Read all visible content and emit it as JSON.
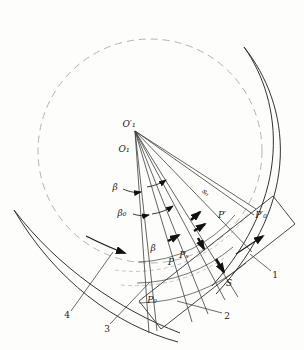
{
  "figure": {
    "kind": "geometric construction diagram (rotor / vane profile with angle fan)",
    "labels": {
      "center_prime": "O′₁",
      "center": "O₁",
      "angle_beta_upper": "β",
      "angle_beta_zero": "β₀",
      "angle_beta_lower": "β",
      "stroke_s_zero": "s₀",
      "point_p_prime": "P′",
      "point_p_zero_prime": "P′₀",
      "point_p": "P",
      "point_p_x": "Pₓ",
      "point_p_zero": "P₀",
      "stroke_s": "S",
      "callout_1": "1",
      "callout_2": "2",
      "callout_3": "3",
      "callout_4": "4"
    },
    "colors": {
      "line": "#333333",
      "thin_arc": "#555555",
      "dashed": "#b3b3b3",
      "arrow_fill": "#111111",
      "background": "#fdfdfc"
    }
  }
}
